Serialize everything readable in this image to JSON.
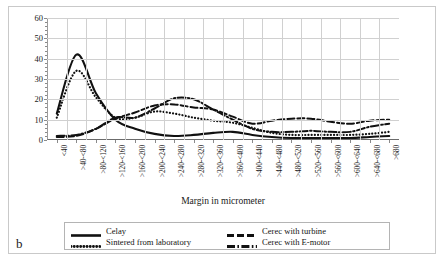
{
  "figure": {
    "letter": "b"
  },
  "axes": {
    "ylabel": "Frequency in %",
    "xlabel": "Margin in micrometer",
    "yticks": [
      0,
      10,
      20,
      30,
      40,
      50,
      60
    ]
  },
  "legend": {
    "items": [
      {
        "label": "Celay",
        "style": "solid"
      },
      {
        "label": "Sintered from laboratory",
        "style": "dotted"
      },
      {
        "label": "Cerec with turbine",
        "style": "dashed"
      },
      {
        "label": "Cerec with E-motor",
        "style": "dashdot"
      }
    ]
  },
  "chart_data": {
    "type": "line",
    "title": "",
    "xlabel": "Margin in micrometer",
    "ylabel": "Frequency in %",
    "ylim": [
      0,
      60
    ],
    "grid": true,
    "legend_position": "bottom",
    "categories": [
      "<40",
      ">40-<80",
      ">80-<120",
      ">120-<160",
      ">160-<200",
      ">200-<240",
      ">240-<280",
      ">280-<320",
      ">320-<360",
      ">360-<400",
      ">400-<440",
      ">440-<480",
      ">480-<520",
      ">520-<560",
      ">560-<600",
      ">600-<640",
      ">640-<680",
      ">680"
    ],
    "series": [
      {
        "name": "Celay",
        "values": [
          13,
          42,
          23,
          10,
          5.5,
          3,
          2,
          2.5,
          3.5,
          4,
          2.5,
          1.5,
          1,
          1,
          1,
          1,
          1.5,
          2
        ]
      },
      {
        "name": "Sintered from laboratory",
        "values": [
          11,
          34,
          21,
          11,
          11,
          14,
          13,
          11,
          9.5,
          8.5,
          6,
          3.5,
          2.5,
          2.5,
          2.5,
          2.5,
          3,
          4
        ]
      },
      {
        "name": "Cerec with turbine",
        "values": [
          1.5,
          2,
          5.5,
          10.5,
          13.5,
          17,
          17.5,
          16,
          15,
          11.5,
          8,
          9.5,
          10.5,
          10.5,
          9,
          8,
          9.5,
          10
        ]
      },
      {
        "name": "Cerec with E-motor",
        "values": [
          2,
          2.5,
          5.5,
          11,
          11,
          15.5,
          20.5,
          20,
          15,
          10,
          5.5,
          4,
          4,
          4.5,
          4,
          4,
          6.5,
          8
        ]
      }
    ]
  }
}
